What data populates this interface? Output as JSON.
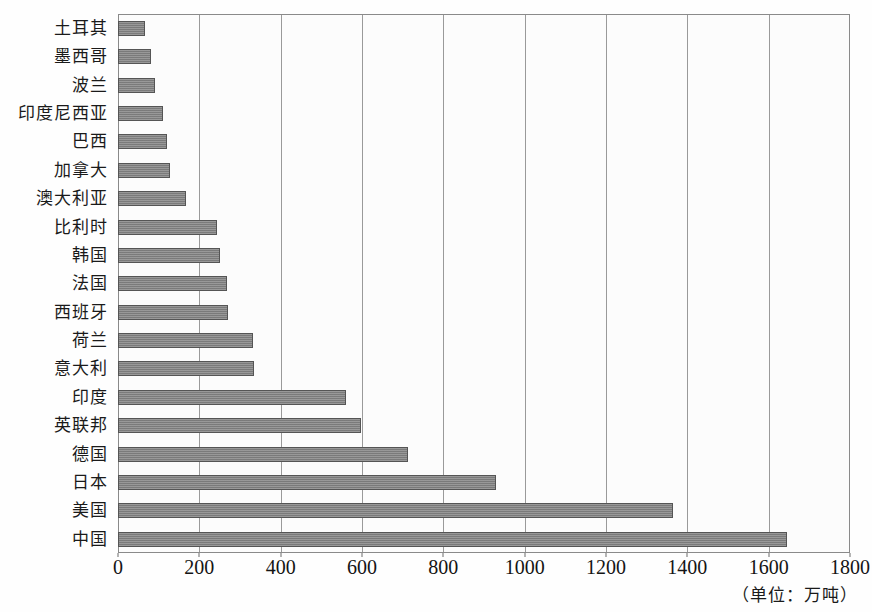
{
  "chart_data": {
    "type": "bar",
    "orientation": "horizontal",
    "title": "",
    "xlabel": "",
    "ylabel": "",
    "unit_note": "（单位：万吨）",
    "xlim": [
      0,
      1800
    ],
    "xticks": [
      0,
      200,
      400,
      600,
      800,
      1000,
      1200,
      1400,
      1600,
      1800
    ],
    "xtick_labels": [
      "0",
      "200",
      "400",
      "600",
      "800",
      "1000",
      "1200",
      "1400",
      "1600",
      "1800"
    ],
    "grid": true,
    "grid_axis": "x",
    "legend": false,
    "bar_color": "#828282",
    "bar_edge_color": "#555555",
    "plot_background": "#fcfcfc",
    "categories": [
      "土耳其",
      "墨西哥",
      "波兰",
      "印度尼西亚",
      "巴西",
      "加拿大",
      "澳大利亚",
      "比利时",
      "韩国",
      "法国",
      "西班牙",
      "荷兰",
      "意大利",
      "印度",
      "英联邦",
      "德国",
      "日本",
      "美国",
      "中国"
    ],
    "values": [
      66,
      81,
      92,
      110,
      120,
      128,
      167,
      243,
      250,
      268,
      270,
      331,
      334,
      561,
      597,
      713,
      929,
      1365,
      1644
    ]
  }
}
